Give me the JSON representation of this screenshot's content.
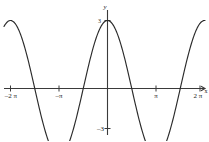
{
  "figure": {
    "background_color": "#ffffff",
    "curve_color": "#2b2b2b",
    "axis_color": "#3a3a3a",
    "width": 209,
    "height": 141
  },
  "axes": {
    "y_axis_name": "y",
    "x_axis_name": "x"
  },
  "labels": {
    "x_neg_2pi": "–2 π",
    "x_neg_pi": "–π",
    "x_pi": "π",
    "x_2pi": "2 π",
    "y_neg_3": "–3",
    "y_3": "3"
  },
  "chart_data": {
    "type": "line",
    "title": "",
    "subtitle": "",
    "xlabel": "x",
    "ylabel": "y",
    "function": "y = 3 cos(x)",
    "amplitude": 3,
    "period": 6.283185307179586,
    "xlim": [
      -6.283185307179586,
      6.283185307179586
    ],
    "ylim": [
      -3.6,
      3.6
    ],
    "grid": false,
    "legend": false,
    "legend_position": "none",
    "xtick_values": [
      -6.283185307179586,
      -3.141592653589793,
      0,
      3.141592653589793,
      6.283185307179586
    ],
    "xtick_labels": [
      "–2 π",
      "–π",
      "",
      "π",
      "2 π"
    ],
    "ytick_values": [
      3,
      -3
    ],
    "ytick_labels": [
      "3",
      "–3"
    ],
    "annotations": [],
    "series": [
      {
        "name": "y = 3 cos(x)",
        "color": "#2b2b2b",
        "x": [
          -6.2832,
          -6.0868,
          -5.8905,
          -5.6941,
          -5.4978,
          -5.3014,
          -5.1051,
          -4.9087,
          -4.7124,
          -4.516,
          -4.3197,
          -4.1233,
          -3.927,
          -3.7306,
          -3.5343,
          -3.3379,
          -3.1416,
          -2.9452,
          -2.7489,
          -2.5525,
          -2.3562,
          -2.1598,
          -1.9635,
          -1.7671,
          -1.5708,
          -1.3744,
          -1.1781,
          -0.9817,
          -0.7854,
          -0.589,
          -0.3927,
          -0.1963,
          0,
          0.1963,
          0.3927,
          0.589,
          0.7854,
          0.9817,
          1.1781,
          1.3744,
          1.5708,
          1.7671,
          1.9635,
          2.1598,
          2.3562,
          2.5525,
          2.7489,
          2.9452,
          3.1416,
          3.3379,
          3.5343,
          3.7306,
          3.927,
          4.1233,
          4.3197,
          4.516,
          4.7124,
          4.9087,
          5.1051,
          5.3014,
          5.4978,
          5.6941,
          5.8905,
          6.0868,
          6.2832
        ],
        "y": [
          3.0,
          2.942,
          2.772,
          2.496,
          2.122,
          1.667,
          1.148,
          0.585,
          0.0,
          -0.585,
          -1.148,
          -1.667,
          -2.122,
          -2.496,
          -2.772,
          -2.942,
          -3.0,
          -2.942,
          -2.772,
          -2.496,
          -2.122,
          -1.667,
          -1.148,
          -0.585,
          0.0,
          0.585,
          1.148,
          1.667,
          2.122,
          2.496,
          2.772,
          2.942,
          3.0,
          2.942,
          2.772,
          2.496,
          2.122,
          1.667,
          1.148,
          0.585,
          0.0,
          -0.585,
          -1.148,
          -1.667,
          -2.122,
          -2.496,
          -2.772,
          -2.942,
          -3.0,
          -2.942,
          -2.772,
          -2.496,
          -2.122,
          -1.667,
          -1.148,
          -0.585,
          0.0,
          0.585,
          1.148,
          1.667,
          2.122,
          2.496,
          2.772,
          2.942,
          3.0
        ]
      }
    ]
  }
}
